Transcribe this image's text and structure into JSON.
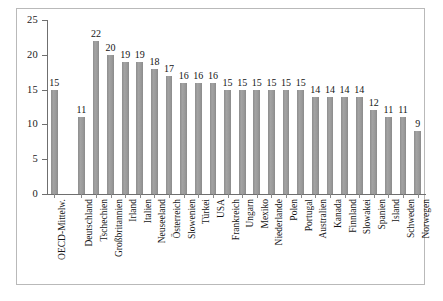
{
  "chart_data": {
    "type": "bar",
    "title": "",
    "subtitle": "",
    "xlabel": "",
    "ylabel": "",
    "ylim": [
      0,
      25
    ],
    "yticks": [
      0,
      5,
      10,
      15,
      20,
      25
    ],
    "grid": false,
    "legend": false,
    "legend_position": "none",
    "bar_color": "#969696",
    "axis_color": "#6f6f6f",
    "frame_color": "#b9b9b9",
    "value_labels": true,
    "categories": [
      "OECD-Mittelw.",
      "Deutschland",
      "Tschechien",
      "Großbritannien",
      "Irland",
      "Italien",
      "Neuseeland",
      "Österreich",
      "Slowenien",
      "Türkei",
      "USA",
      "Frankreich",
      "Ungarn",
      "Mexiko",
      "Niederlande",
      "Polen",
      "Portugal",
      "Australien",
      "Kanada",
      "Finnland",
      "Slowakei",
      "Spanien",
      "Island",
      "Schweden",
      "Norwegen"
    ],
    "values": [
      15,
      11,
      22,
      20,
      19,
      19,
      18,
      17,
      16,
      16,
      16,
      15,
      15,
      15,
      15,
      15,
      15,
      14,
      14,
      14,
      14,
      12,
      11,
      11,
      9
    ],
    "separator_after_index": 0
  }
}
